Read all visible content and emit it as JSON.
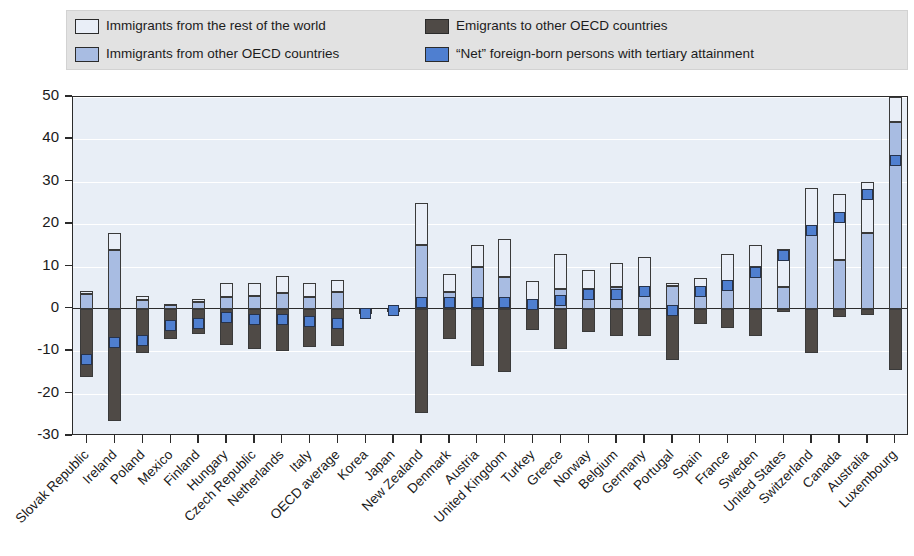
{
  "legend": {
    "items": [
      {
        "key": "row",
        "label": "Immigrants from the rest of the world",
        "color": "#e9eef7",
        "col": 0
      },
      {
        "key": "oecd",
        "label": "Immigrants from other OECD countries",
        "color": "#a8bce2",
        "col": 0
      },
      {
        "key": "emi",
        "label": "Emigrants to other OECD countries",
        "color": "#4f4a46",
        "col": 1
      },
      {
        "key": "net",
        "label": "“Net” foreign-born persons with tertiary attainment",
        "color": "#4f7fd0",
        "col": 1
      }
    ]
  },
  "axis": {
    "y_ticks": [
      "50",
      "40",
      "30",
      "20",
      "10",
      "0",
      "-10",
      "-20",
      "-30"
    ],
    "y_min": -30,
    "y_max": 50,
    "y_step": 10
  },
  "chart_data": {
    "type": "bar",
    "title": "",
    "subtitle": "",
    "xlabel": "",
    "ylabel": "",
    "ylim": [
      -30,
      50
    ],
    "grid": true,
    "stacked": true,
    "legend_position": "top",
    "categories": [
      "Slovak Republic",
      "Ireland",
      "Poland",
      "Mexico",
      "Finland",
      "Hungary",
      "Czech Republic",
      "Netherlands",
      "Italy",
      "OECD average",
      "Korea",
      "Japan",
      "New Zealand",
      "Denmark",
      "Austria",
      "United Kingdom",
      "Turkey",
      "Greece",
      "Norway",
      "Belgium",
      "Germany",
      "Portugal",
      "Spain",
      "France",
      "Sweden",
      "United States",
      "Switzerland",
      "Canada",
      "Australia",
      "Luxembourg"
    ],
    "series": [
      {
        "name": "Immigrants from other OECD countries",
        "key": "oecd",
        "color": "#a8bce2",
        "values": [
          3.6,
          14.0,
          2.2,
          0.8,
          1.6,
          2.7,
          3.0,
          3.8,
          2.8,
          4.0,
          0.0,
          0.0,
          15.0,
          4.0,
          10.0,
          7.5,
          1.8,
          4.6,
          4.6,
          5.2,
          5.2,
          5.5,
          5.2,
          5.5,
          10.0,
          5.1,
          18.0,
          11.5,
          18.0,
          44.0
        ]
      },
      {
        "name": "Immigrants from the rest of the world",
        "key": "row",
        "color": "#e9eef7",
        "values": [
          0.7,
          4.0,
          0.8,
          0.4,
          0.8,
          3.3,
          3.0,
          4.0,
          3.3,
          2.7,
          0.0,
          0.0,
          10.0,
          4.2,
          5.0,
          9.0,
          4.7,
          8.4,
          4.5,
          5.7,
          7.0,
          0.7,
          2.0,
          7.5,
          5.0,
          9.0,
          10.5,
          15.5,
          12.0,
          6.0
        ]
      },
      {
        "name": "Emigrants to other OECD countries",
        "key": "emi",
        "color": "#4f4a46",
        "values": [
          -16.0,
          -26.5,
          -10.5,
          -7.0,
          -6.0,
          -8.5,
          -9.5,
          -10.0,
          -9.0,
          -8.7,
          -1.2,
          -0.8,
          -24.5,
          -7.0,
          -13.5,
          -15.0,
          -5.0,
          -9.5,
          -5.5,
          -6.5,
          -6.5,
          -12.0,
          -3.5,
          -4.5,
          -6.5,
          -0.7,
          -10.5,
          -2.0,
          -1.5,
          -14.5
        ]
      }
    ],
    "net_markers": {
      "name": "“Net” foreign-born persons with tertiary attainment",
      "color": "#4f7fd0",
      "values": [
        -12.0,
        -8.0,
        -7.5,
        -4.0,
        -3.5,
        -2.0,
        -2.5,
        -2.5,
        -3.0,
        -3.5,
        -1.0,
        -0.5,
        1.5,
        1.5,
        1.5,
        1.5,
        1.0,
        2.0,
        3.5,
        3.5,
        4.0,
        -0.5,
        4.0,
        5.5,
        8.5,
        12.5,
        18.5,
        21.5,
        27.0,
        35.0
      ]
    }
  }
}
